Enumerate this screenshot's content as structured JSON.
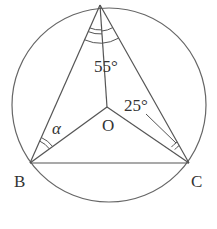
{
  "diagram": {
    "type": "geometry",
    "circle": {
      "center": "O"
    },
    "points": {
      "A": {
        "label": ""
      },
      "B": {
        "label": "B"
      },
      "C": {
        "label": "C"
      },
      "O": {
        "label": "O"
      }
    },
    "angles": {
      "apex": {
        "label": "55°"
      },
      "OCA": {
        "label": "25°"
      },
      "ABO": {
        "label": "α"
      }
    },
    "colors": {
      "stroke": "#555555",
      "text": "#333333"
    }
  }
}
